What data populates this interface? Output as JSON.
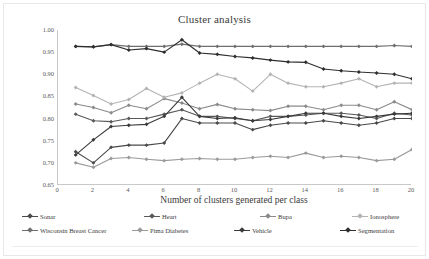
{
  "chart_data": {
    "type": "line",
    "title": "Cluster analysis",
    "xlabel": "Number of clusters generated per class",
    "ylabel": "Classification accuracy",
    "xlim": [
      0,
      20
    ],
    "ylim": [
      0.65,
      1.0
    ],
    "ytick_labels": [
      "0.65",
      "0.70",
      "0.75",
      "0.80",
      "0.85",
      "0.90",
      "0.95",
      "1.00"
    ],
    "ytick_values": [
      0.65,
      0.7,
      0.75,
      0.8,
      0.85,
      0.9,
      0.95,
      1.0
    ],
    "xtick_labels": [
      "0",
      "2",
      "4",
      "6",
      "8",
      "10",
      "12",
      "14",
      "16",
      "18",
      "20"
    ],
    "xtick_values": [
      0,
      2,
      4,
      6,
      8,
      10,
      12,
      14,
      16,
      18,
      20
    ],
    "grid": false,
    "legend_position": "bottom",
    "x": [
      1,
      2,
      3,
      4,
      5,
      6,
      7,
      8,
      9,
      10,
      11,
      12,
      13,
      14,
      15,
      16,
      17,
      18,
      19,
      20
    ],
    "series": [
      {
        "name": "Sonar",
        "color": "#4a4a4a",
        "values": [
          0.725,
          0.7,
          0.735,
          0.74,
          0.74,
          0.745,
          0.8,
          0.79,
          0.79,
          0.79,
          0.775,
          0.785,
          0.79,
          0.79,
          0.795,
          0.79,
          0.785,
          0.79,
          0.8,
          0.8
        ]
      },
      {
        "name": "Heart",
        "color": "#595959",
        "values": [
          0.81,
          0.795,
          0.793,
          0.8,
          0.8,
          0.81,
          0.82,
          0.805,
          0.805,
          0.8,
          0.795,
          0.805,
          0.805,
          0.808,
          0.812,
          0.812,
          0.808,
          0.8,
          0.812,
          0.808
        ]
      },
      {
        "name": "Bupa",
        "color": "#8a8a8a",
        "values": [
          0.833,
          0.825,
          0.813,
          0.83,
          0.822,
          0.845,
          0.835,
          0.822,
          0.832,
          0.822,
          0.82,
          0.818,
          0.828,
          0.828,
          0.82,
          0.83,
          0.83,
          0.82,
          0.838,
          0.82
        ]
      },
      {
        "name": "Ionosphere",
        "color": "#b4b4b4",
        "values": [
          0.87,
          0.852,
          0.833,
          0.843,
          0.868,
          0.848,
          0.858,
          0.88,
          0.9,
          0.89,
          0.862,
          0.9,
          0.88,
          0.872,
          0.872,
          0.88,
          0.89,
          0.872,
          0.88,
          0.88
        ]
      },
      {
        "name": "Wisconsin Breast Cancer",
        "color": "#6f6f6f",
        "values": [
          0.963,
          0.962,
          0.967,
          0.963,
          0.963,
          0.963,
          0.968,
          0.963,
          0.963,
          0.963,
          0.963,
          0.963,
          0.963,
          0.963,
          0.963,
          0.963,
          0.963,
          0.963,
          0.965,
          0.963
        ]
      },
      {
        "name": "Pima Diabetes",
        "color": "#9a9a9a",
        "values": [
          0.7,
          0.69,
          0.71,
          0.712,
          0.708,
          0.705,
          0.708,
          0.71,
          0.708,
          0.708,
          0.712,
          0.715,
          0.712,
          0.722,
          0.712,
          0.715,
          0.712,
          0.705,
          0.708,
          0.73
        ]
      },
      {
        "name": "Vehicle",
        "color": "#3a3a3a",
        "values": [
          0.718,
          0.752,
          0.782,
          0.785,
          0.787,
          0.805,
          0.848,
          0.805,
          0.8,
          0.802,
          0.795,
          0.798,
          0.805,
          0.812,
          0.812,
          0.805,
          0.8,
          0.805,
          0.81,
          0.812
        ]
      },
      {
        "name": "Segmentation",
        "color": "#2e2e2e",
        "values": [
          0.963,
          0.962,
          0.967,
          0.955,
          0.958,
          0.95,
          0.978,
          0.948,
          0.945,
          0.94,
          0.937,
          0.932,
          0.928,
          0.927,
          0.912,
          0.908,
          0.905,
          0.903,
          0.9,
          0.89
        ]
      }
    ]
  },
  "legend": {
    "rows": [
      [
        "Sonar",
        "Heart",
        "Bupa",
        "Ionosphere"
      ],
      [
        "Wisconsin Breast Cancer",
        "Pima Diabetes",
        "Vehicle",
        "Segmentation"
      ]
    ]
  }
}
